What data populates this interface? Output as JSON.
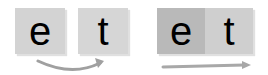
{
  "left_group": {
    "tiles": [
      {
        "letter": "e",
        "color": "#d3d3d3"
      },
      {
        "letter": "t",
        "color": "#d6d6d6"
      }
    ],
    "arrow": {
      "type": "curved-arrow",
      "direction": "left-to-right",
      "color": "#9a9a9a"
    }
  },
  "right_group": {
    "tiles": [
      {
        "letter": "e",
        "color": "#b9b9b9"
      },
      {
        "letter": "t",
        "color": "#cfcfcf"
      }
    ],
    "arrow": {
      "type": "straight-arrow",
      "direction": "left-to-right",
      "color": "#9a9a9a"
    }
  }
}
